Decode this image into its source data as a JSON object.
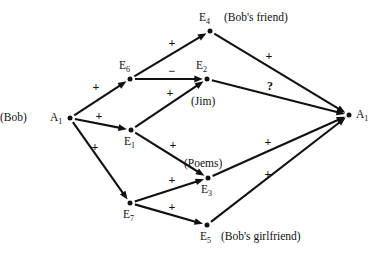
{
  "diagram": {
    "type": "directed-graph",
    "background_color": "#ffffff",
    "ink_color": "#111111",
    "width": 381,
    "height": 260,
    "nodes": [
      {
        "id": "A1_left",
        "base": "A",
        "sub": "1",
        "x": 70,
        "y": 118,
        "label_side": "left",
        "annotation": "(Bob)",
        "annotation_side": "left"
      },
      {
        "id": "E6",
        "base": "E",
        "sub": "6",
        "x": 130,
        "y": 79,
        "label_side": "above",
        "annotation": "",
        "annotation_side": ""
      },
      {
        "id": "E1",
        "base": "E",
        "sub": "1",
        "x": 131,
        "y": 130,
        "label_side": "below",
        "annotation": "",
        "annotation_side": ""
      },
      {
        "id": "E7",
        "base": "E",
        "sub": "7",
        "x": 130,
        "y": 203,
        "label_side": "below",
        "annotation": "",
        "annotation_side": ""
      },
      {
        "id": "E4",
        "base": "E",
        "sub": "4",
        "x": 210,
        "y": 31,
        "label_side": "above",
        "annotation": "(Bob's friend)",
        "annotation_side": "right"
      },
      {
        "id": "E2",
        "base": "E",
        "sub": "2",
        "x": 207,
        "y": 79,
        "label_side": "above",
        "annotation": "(Jim)",
        "annotation_side": "below"
      },
      {
        "id": "E3",
        "base": "E",
        "sub": "3",
        "x": 208,
        "y": 178,
        "label_side": "below",
        "annotation": "(Poems)",
        "annotation_side": "above"
      },
      {
        "id": "E5",
        "base": "E",
        "sub": "5",
        "x": 207,
        "y": 225,
        "label_side": "below",
        "annotation": "(Bob's girlfriend)",
        "annotation_side": "right"
      },
      {
        "id": "A1_right",
        "base": "A",
        "sub": "1",
        "x": 349,
        "y": 115,
        "label_side": "right",
        "annotation": "",
        "annotation_side": ""
      }
    ],
    "edges": [
      {
        "id": "e1",
        "from": "A1_left",
        "to": "E6",
        "sign": "+",
        "sign_x": 96,
        "sign_y": 87
      },
      {
        "id": "e2",
        "from": "A1_left",
        "to": "E1",
        "sign": "+",
        "sign_x": 99,
        "sign_y": 116
      },
      {
        "id": "e3",
        "from": "A1_left",
        "to": "E7",
        "sign": "+",
        "sign_x": 95,
        "sign_y": 147
      },
      {
        "id": "e4",
        "from": "E6",
        "to": "E4",
        "sign": "+",
        "sign_x": 172,
        "sign_y": 43
      },
      {
        "id": "e5",
        "from": "E6",
        "to": "E2",
        "sign": "−",
        "sign_x": 172,
        "sign_y": 71
      },
      {
        "id": "e6",
        "from": "E1",
        "to": "E2",
        "sign": "+",
        "sign_x": 170,
        "sign_y": 93
      },
      {
        "id": "e7",
        "from": "E1",
        "to": "E3",
        "sign": "+",
        "sign_x": 173,
        "sign_y": 145
      },
      {
        "id": "e8",
        "from": "E7",
        "to": "E3",
        "sign": "+",
        "sign_x": 172,
        "sign_y": 180
      },
      {
        "id": "e9",
        "from": "E7",
        "to": "E5",
        "sign": "+",
        "sign_x": 172,
        "sign_y": 207
      },
      {
        "id": "e10",
        "from": "E4",
        "to": "A1_right",
        "sign": "+",
        "sign_x": 269,
        "sign_y": 56
      },
      {
        "id": "e11",
        "from": "E2",
        "to": "A1_right",
        "sign": "?",
        "sign_x": 270,
        "sign_y": 86
      },
      {
        "id": "e12",
        "from": "E3",
        "to": "A1_right",
        "sign": "+",
        "sign_x": 268,
        "sign_y": 142
      },
      {
        "id": "e13",
        "from": "E5",
        "to": "A1_right",
        "sign": "+",
        "sign_x": 268,
        "sign_y": 174
      }
    ]
  }
}
